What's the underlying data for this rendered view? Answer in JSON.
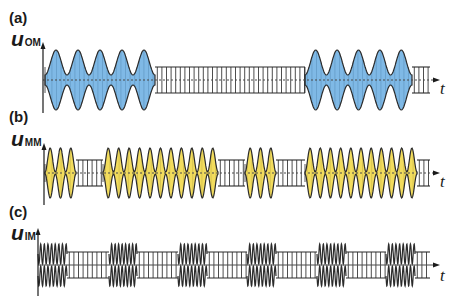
{
  "figure": {
    "panels": [
      {
        "id": "a",
        "label": "(a)",
        "ylabel_main": "u",
        "ylabel_sub": "OM",
        "xlabel": "t",
        "fill_color": "#7fb9e6",
        "description": "AM bursts over carrier",
        "layout": {
          "axis_x": 43,
          "center_y": 80,
          "axis_top": 42,
          "axis_bottom": 113,
          "end_x": 440
        },
        "segments": [
          {
            "type": "am",
            "x0": 45,
            "x1": 155,
            "lobes": 5
          },
          {
            "type": "carrier",
            "x0": 155,
            "x1": 305
          },
          {
            "type": "am",
            "x0": 305,
            "x1": 412,
            "lobes": 5
          },
          {
            "type": "carrier",
            "x0": 412,
            "x1": 430
          }
        ]
      },
      {
        "id": "b",
        "label": "(b)",
        "ylabel_main": "u",
        "ylabel_sub": "MM",
        "xlabel": "t",
        "fill_color": "#f2dc5d",
        "description": "AM bursts with higher modulation rate",
        "layout": {
          "axis_x": 44,
          "center_y": 173,
          "axis_top": 143,
          "axis_bottom": 205,
          "end_x": 440
        },
        "segments": [
          {
            "type": "am",
            "x0": 45,
            "x1": 76,
            "lobes": 3
          },
          {
            "type": "carrier",
            "x0": 76,
            "x1": 103
          },
          {
            "type": "am",
            "x0": 103,
            "x1": 218,
            "lobes": 11
          },
          {
            "type": "carrier",
            "x0": 218,
            "x1": 245
          },
          {
            "type": "am",
            "x0": 245,
            "x1": 276,
            "lobes": 3
          },
          {
            "type": "carrier",
            "x0": 276,
            "x1": 305
          },
          {
            "type": "am",
            "x0": 305,
            "x1": 417,
            "lobes": 11
          },
          {
            "type": "carrier",
            "x0": 417,
            "x1": 430
          }
        ]
      },
      {
        "id": "c",
        "label": "(c)",
        "ylabel_main": "u",
        "ylabel_sub": "IM",
        "xlabel": "t",
        "fill_color": "none",
        "description": "Interferential bursts over carrier",
        "layout": {
          "axis_x": 38,
          "center_y": 265,
          "axis_top": 228,
          "axis_bottom": 296,
          "end_x": 440
        },
        "segments": [
          {
            "type": "burst",
            "x0": 38,
            "x1": 67,
            "cycles": 4
          },
          {
            "type": "carrier",
            "x0": 67,
            "x1": 109
          },
          {
            "type": "burst",
            "x0": 109,
            "x1": 137,
            "cycles": 4
          },
          {
            "type": "carrier",
            "x0": 137,
            "x1": 178
          },
          {
            "type": "burst",
            "x0": 178,
            "x1": 207,
            "cycles": 4
          },
          {
            "type": "carrier",
            "x0": 207,
            "x1": 247
          },
          {
            "type": "burst",
            "x0": 247,
            "x1": 276,
            "cycles": 4
          },
          {
            "type": "carrier",
            "x0": 276,
            "x1": 317
          },
          {
            "type": "burst",
            "x0": 317,
            "x1": 346,
            "cycles": 4
          },
          {
            "type": "carrier",
            "x0": 346,
            "x1": 386
          },
          {
            "type": "burst",
            "x0": 386,
            "x1": 415,
            "cycles": 4
          },
          {
            "type": "carrier",
            "x0": 415,
            "x1": 430
          }
        ]
      }
    ],
    "colors": {
      "line": "#2b2b2b",
      "axis": "#1a1a1a",
      "hatch": "#3a3a3a",
      "center_dash": "#4a4a4a"
    }
  }
}
